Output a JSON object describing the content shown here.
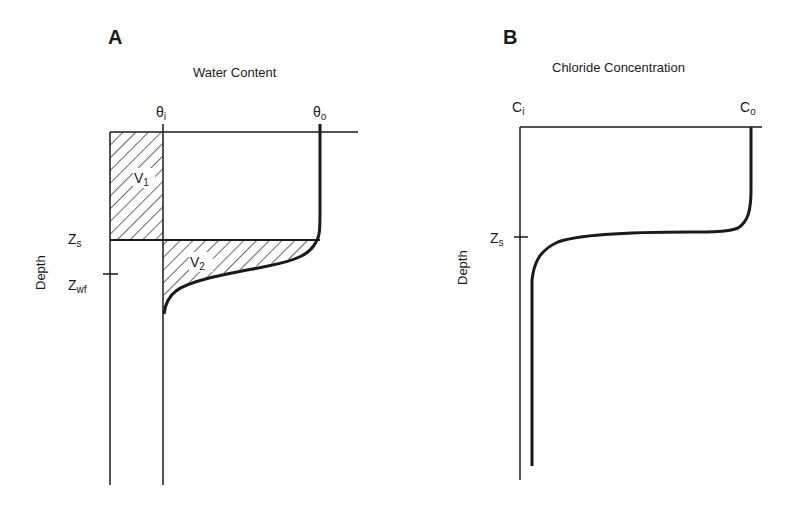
{
  "panels": [
    {
      "id": "A",
      "label": "A",
      "title": "Water Content",
      "x_markers": [
        {
          "symbol": "θ",
          "sub": "i"
        },
        {
          "symbol": "θ",
          "sub": "o"
        }
      ],
      "y_label": "Depth",
      "depth_markers": [
        {
          "symbol": "Z",
          "sub": "s"
        },
        {
          "symbol": "Z",
          "sub": "wf"
        }
      ],
      "regions": [
        {
          "symbol": "V",
          "sub": "1"
        },
        {
          "symbol": "V",
          "sub": "2"
        }
      ]
    },
    {
      "id": "B",
      "label": "B",
      "title": "Chloride Concentration",
      "x_markers": [
        {
          "symbol": "C",
          "sub": "i"
        },
        {
          "symbol": "C",
          "sub": "o"
        }
      ],
      "y_label": "Depth",
      "depth_markers": [
        {
          "symbol": "Z",
          "sub": "s"
        }
      ]
    }
  ],
  "colors": {
    "ink": "#1a1a1a",
    "background": "#ffffff"
  }
}
